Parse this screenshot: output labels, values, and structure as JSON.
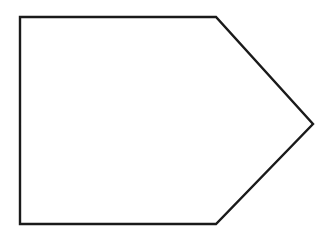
{
  "canvas": {
    "width": 335,
    "height": 242,
    "background_color": "#ffffff",
    "alt_text": "Pentagon outline shape resembling an arrow or home plate pointing right"
  },
  "figure": {
    "name": "pentagon-arrow-outline",
    "shape_type": "pentagon",
    "stroke_color": "#1a1a1a",
    "fill_color": "#ffffff",
    "stroke_width": 2.4,
    "vertices": [
      {
        "name": "top-left-corner",
        "x": 20,
        "y": 17
      },
      {
        "name": "top-right-bend",
        "x": 216,
        "y": 17
      },
      {
        "name": "right-tip",
        "x": 313,
        "y": 124
      },
      {
        "name": "bottom-right-bend",
        "x": 216,
        "y": 224
      },
      {
        "name": "bottom-left-corner",
        "x": 20,
        "y": 224
      }
    ],
    "edges": [
      {
        "name": "top-edge",
        "from": "top-left-corner",
        "to": "top-right-bend"
      },
      {
        "name": "upper-slant-edge",
        "from": "top-right-bend",
        "to": "right-tip"
      },
      {
        "name": "lower-slant-edge",
        "from": "right-tip",
        "to": "bottom-right-bend"
      },
      {
        "name": "bottom-edge",
        "from": "bottom-right-bend",
        "to": "bottom-left-corner"
      },
      {
        "name": "left-edge",
        "from": "bottom-left-corner",
        "to": "top-left-corner"
      }
    ],
    "points_string": "20,17 216,17 313,124 216,224 20,224"
  }
}
